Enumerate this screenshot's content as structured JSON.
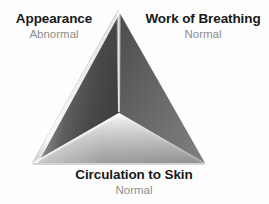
{
  "figure": {
    "name": "pediatric-assessment-triangle",
    "shape": "triangle",
    "background_color": "#fdfdfd"
  },
  "vertices": {
    "apex": {
      "x": 118,
      "y": 10
    },
    "bottom_left": {
      "x": 32,
      "y": 163
    },
    "bottom_right": {
      "x": 205,
      "y": 163
    },
    "center": {
      "x": 119,
      "y": 113
    }
  },
  "faces": [
    {
      "name": "left-face",
      "corresponds_to": "Appearance",
      "fill_light": "#f2f2f2",
      "fill_dark": "#4a4a4a"
    },
    {
      "name": "right-face",
      "corresponds_to": "Work of Breathing",
      "fill_light": "#7a7a7a",
      "fill_dark": "#4f4f4f"
    },
    {
      "name": "bottom-face",
      "corresponds_to": "Circulation to Skin",
      "fill_light": "#f4f4f4",
      "fill_dark": "#8f8f8f"
    }
  ],
  "labels": {
    "appearance": {
      "title": "Appearance",
      "value": "Abnormal"
    },
    "work_of_breathing": {
      "title": "Work of Breathing",
      "value": "Normal"
    },
    "circulation_to_skin": {
      "title": "Circulation to Skin",
      "value": "Normal"
    }
  },
  "colors": {
    "title_color": "#191919",
    "value_color": "#8d8d8d",
    "background": "#fdfdfd"
  }
}
